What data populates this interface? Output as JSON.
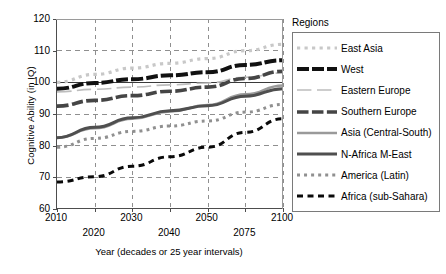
{
  "chart_data": {
    "type": "line",
    "title": "",
    "xlabel": "Year (decades or 25 year intervals)",
    "ylabel": "Cognitive Ability (in IQ)",
    "legend_title": "Regions",
    "legend_position": "right",
    "grid": true,
    "x": [
      "2010",
      "2020",
      "2030",
      "2040",
      "2050",
      "2075",
      "2100"
    ],
    "x_tick_labels_row_a": [
      "2010",
      "",
      "2030",
      "",
      "2050",
      "",
      "2100"
    ],
    "x_tick_labels_row_b": [
      "",
      "2020",
      "",
      "2040",
      "",
      "2075",
      ""
    ],
    "ylim": [
      60,
      120
    ],
    "y_ticks": [
      60,
      70,
      80,
      90,
      100,
      110,
      120
    ],
    "series": [
      {
        "name": "East Asia",
        "values": [
          100.0,
          102.5,
          104.5,
          106.0,
          107.5,
          110.0,
          112.0
        ],
        "color": "#c8c8c8",
        "style": "dotted-square",
        "width": 3.2
      },
      {
        "name": "West",
        "values": [
          98.0,
          99.8,
          101.0,
          102.2,
          103.2,
          105.5,
          107.0
        ],
        "color": "#111111",
        "style": "dashed-thick",
        "width": 4.0
      },
      {
        "name": "Eastern Europe",
        "values": [
          97.0,
          97.8,
          98.5,
          99.2,
          99.8,
          101.6,
          103.0
        ],
        "color": "#bdbdbd",
        "style": "solid-thin",
        "width": 1.6
      },
      {
        "name": "Southern Europe",
        "values": [
          92.5,
          94.3,
          95.8,
          97.2,
          98.5,
          101.2,
          103.5
        ],
        "color": "#454545",
        "style": "dashed-medium",
        "width": 3.6
      },
      {
        "name": "Asia (Central-South)",
        "values": [
          82.5,
          85.5,
          88.5,
          90.8,
          92.8,
          96.2,
          99.0
        ],
        "color": "#9a9a9a",
        "style": "solid-medium",
        "width": 2.6
      },
      {
        "name": "N-Africa M-East",
        "values": [
          82.5,
          85.8,
          88.8,
          91.0,
          92.6,
          95.6,
          98.0
        ],
        "color": "#4f4f4f",
        "style": "solid-thick",
        "width": 3.0
      },
      {
        "name": "America (Latin)",
        "values": [
          79.5,
          82.3,
          84.5,
          86.2,
          87.8,
          90.6,
          93.0
        ],
        "color": "#909090",
        "style": "dotted-square",
        "width": 3.0
      },
      {
        "name": "Africa (sub-Sahara)",
        "values": [
          68.5,
          70.2,
          73.5,
          76.5,
          79.5,
          84.2,
          88.5
        ],
        "color": "#0a0a0a",
        "style": "dashed-small",
        "width": 3.0
      }
    ]
  },
  "legend": {
    "title": "Regions",
    "items": [
      {
        "label": "East Asia"
      },
      {
        "label": "West"
      },
      {
        "label": "Eastern Europe"
      },
      {
        "label": "Southern Europe"
      },
      {
        "label": "Asia (Central-South)"
      },
      {
        "label": "N-Africa M-East"
      },
      {
        "label": "America (Latin)"
      },
      {
        "label": "Africa (sub-Sahara)"
      }
    ]
  }
}
